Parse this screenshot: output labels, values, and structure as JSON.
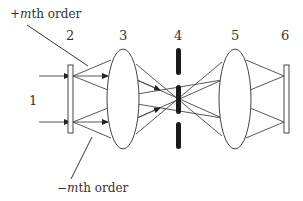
{
  "diagram": {
    "annotations": {
      "plus_order": {
        "sign": "+",
        "var": "m",
        "rest": "th order"
      },
      "minus_order": {
        "sign": "−",
        "var": "m",
        "rest": "th order"
      }
    },
    "components": [
      {
        "id": "1",
        "label": "1",
        "role": "input beams"
      },
      {
        "id": "2",
        "label": "2",
        "role": "grating / object plane"
      },
      {
        "id": "3",
        "label": "3",
        "role": "first lens"
      },
      {
        "id": "4",
        "label": "4",
        "role": "spatial filter (Fourier plane stop)"
      },
      {
        "id": "5",
        "label": "5",
        "role": "second lens"
      },
      {
        "id": "6",
        "label": "6",
        "role": "image plane"
      }
    ],
    "colors": {
      "line": "#444444",
      "stop": "#1a1a1a",
      "background": "#ffffff"
    }
  }
}
